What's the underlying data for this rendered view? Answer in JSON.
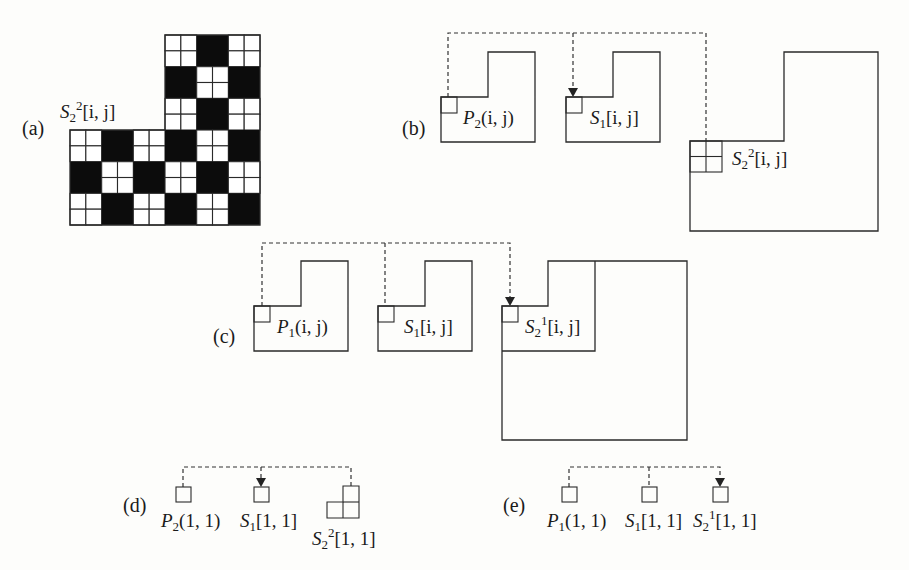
{
  "figure": {
    "parts": {
      "a": {
        "label": "(a)",
        "matrix_label": {
          "base": "S",
          "sub": "2",
          "sup": "2",
          "args": "[i, j]"
        },
        "grid": {
          "block_size_cells": 2,
          "top_rows": [
            [
              "W",
              "B",
              "W"
            ],
            [
              "B",
              "W",
              "B"
            ],
            [
              "W",
              "B",
              "W"
            ]
          ],
          "bottom_rows": [
            [
              "W",
              "B",
              "W",
              "B",
              "W",
              "B"
            ],
            [
              "B",
              "W",
              "B",
              "W",
              "B",
              "W"
            ],
            [
              "W",
              "B",
              "W",
              "B",
              "W",
              "B"
            ]
          ]
        }
      },
      "b": {
        "label": "(b)",
        "shapes": [
          {
            "name": "P",
            "sub": "2",
            "sup": "",
            "args": "(i, j)"
          },
          {
            "name": "S",
            "sub": "1",
            "sup": "",
            "args": "[i, j]"
          },
          {
            "name": "S",
            "sub": "2",
            "sup": "2",
            "args": "[i, j]"
          }
        ],
        "arrow_target": "S1[i, j]"
      },
      "c": {
        "label": "(c)",
        "shapes": [
          {
            "name": "P",
            "sub": "1",
            "sup": "",
            "args": "(i, j)"
          },
          {
            "name": "S",
            "sub": "1",
            "sup": "",
            "args": "[i, j]"
          },
          {
            "name": "S",
            "sub": "2",
            "sup": "1",
            "args": "[i, j]"
          }
        ],
        "arrow_target": "S2^1[i, j]"
      },
      "d": {
        "label": "(d)",
        "shapes": [
          {
            "name": "P",
            "sub": "2",
            "sup": "",
            "args": "(1, 1)"
          },
          {
            "name": "S",
            "sub": "1",
            "sup": "",
            "args": "[1, 1]"
          },
          {
            "name": "S",
            "sub": "2",
            "sup": "2",
            "args": "[1, 1]"
          }
        ],
        "arrow_target": "S1[1, 1]"
      },
      "e": {
        "label": "(e)",
        "shapes": [
          {
            "name": "P",
            "sub": "1",
            "sup": "",
            "args": "(1, 1)"
          },
          {
            "name": "S",
            "sub": "1",
            "sup": "",
            "args": "[1, 1]"
          },
          {
            "name": "S",
            "sub": "2",
            "sup": "1",
            "args": "[1, 1]"
          }
        ],
        "arrow_target": "S2^1[1, 1]"
      }
    }
  }
}
